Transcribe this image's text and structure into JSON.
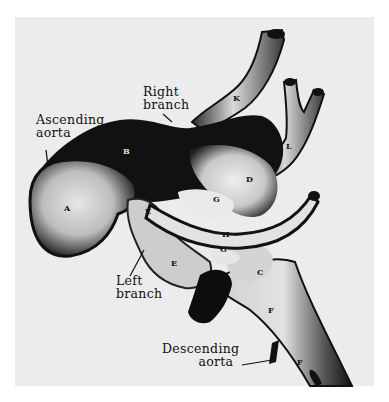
{
  "figure": {
    "type": "anatomical-illustration",
    "colors": {
      "page": "#ffffff",
      "panel": "#ececec",
      "vessel_dark": "#111111",
      "vessel_light": "#d8d8d8"
    }
  },
  "labels": {
    "ascending_aorta": {
      "line1": "Ascending",
      "line2": "aorta"
    },
    "right_branch": {
      "line1": "Right",
      "line2": "branch"
    },
    "left_branch": {
      "line1": "Left",
      "line2": "branch"
    },
    "descending_aorta": {
      "line1": "Descending",
      "line2": "aorta"
    }
  },
  "letters": {
    "A": "A",
    "B": "B",
    "C": "C",
    "D": "D",
    "E1": "E",
    "E2": "E",
    "F1": "F",
    "F2": "F",
    "G1": "G",
    "G2": "G",
    "H": "H",
    "K": "K",
    "L": "L"
  }
}
